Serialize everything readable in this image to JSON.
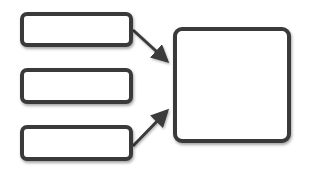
{
  "diagram": {
    "type": "many-to-one flow",
    "colors": {
      "stroke": "#3a3a3a",
      "fill": "#ffffff",
      "background": "#ffffff"
    },
    "inputs": [
      {
        "id": "input-1",
        "label": "",
        "x": 20,
        "y": 12,
        "w": 113,
        "h": 35
      },
      {
        "id": "input-2",
        "label": "",
        "x": 20,
        "y": 68,
        "w": 113,
        "h": 36
      },
      {
        "id": "input-3",
        "label": "",
        "x": 20,
        "y": 125,
        "w": 113,
        "h": 36
      }
    ],
    "output": {
      "id": "output",
      "label": "",
      "x": 173,
      "y": 27,
      "w": 118,
      "h": 116
    },
    "arrows": [
      {
        "from": "input-1",
        "to": "output",
        "x1": 133,
        "y1": 30,
        "x2": 171,
        "y2": 64
      },
      {
        "from": "input-2",
        "to": "output",
        "x1": 133,
        "y1": 86,
        "x2": 171,
        "y2": 86
      },
      {
        "from": "input-3",
        "to": "output",
        "x1": 133,
        "y1": 146,
        "x2": 171,
        "y2": 108
      }
    ]
  }
}
